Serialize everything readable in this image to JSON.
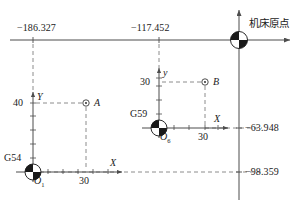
{
  "figure": {
    "type": "cnc-work-coordinate-offset-diagram",
    "machine_origin_label": "机床原点",
    "machine_axes": {
      "x_axis_name": "machine-x-axis",
      "y_axis_name": "machine-y-axis"
    },
    "offset_labels": {
      "g54_x": "−186.327",
      "g59_x": "−117.452",
      "g59_y": "−63.948",
      "g54_y": "−98.359"
    },
    "systems": [
      {
        "code": "G54",
        "origin_label": "O",
        "origin_sub": "1",
        "x_axis_label": "X",
        "y_axis_label": "Y",
        "x_tick_label": "30",
        "y_tick_label": "40",
        "point_label": "A"
      },
      {
        "code": "G59",
        "origin_label": "O",
        "origin_sub": "6",
        "x_axis_label": "X",
        "y_axis_label": "y",
        "x_tick_label": "30",
        "y_tick_label": "30",
        "point_label": "B"
      }
    ],
    "colors": {
      "line": "#4d4d4d",
      "text": "#1a1a1a",
      "dashed": "#808080"
    }
  }
}
